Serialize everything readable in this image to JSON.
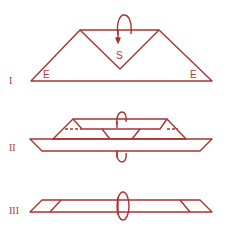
{
  "figures": [
    {
      "numeral": "I",
      "labels": {
        "center": "S",
        "left": "E",
        "right": "E"
      }
    },
    {
      "numeral": "II"
    },
    {
      "numeral": "III"
    }
  ],
  "colors": {
    "line": "#a83232",
    "background": "#ffffff"
  }
}
